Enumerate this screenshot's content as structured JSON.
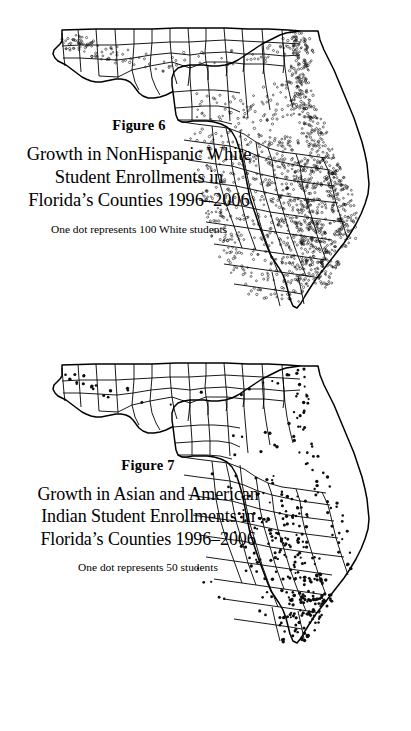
{
  "document": {
    "type": "scanned-journal-page",
    "background_color": "#ffffff",
    "ink_color": "#000000",
    "figure_count": 2
  },
  "figures": [
    {
      "id": "figure-6",
      "number_label": "Figure 6",
      "title": "Growth in NonHispanic White\nStudent Enrollments in\nFlorida’s Counties 1996–2006",
      "title_lines": [
        "Growth in NonHispanic White",
        "Student Enrollments in",
        "Florida’s Counties 1996–2006"
      ],
      "legend_caption": "One dot represents 100 White students",
      "map": {
        "subject": "Florida counties",
        "symbology": "dot-density",
        "dot_value": 100,
        "dot_unit": "White students",
        "period": "1996–2006",
        "dot_style": "small open circle",
        "dot_count_rendered": 980
      }
    },
    {
      "id": "figure-7",
      "number_label": "Figure 7",
      "title": "Growth in Asian and American\nIndian Student Enrollments in\nFlorida’s Counties 1996–2006",
      "title_lines": [
        "Growth in Asian and American",
        "Indian Student Enrollments in",
        "Florida’s Counties 1996–2006"
      ],
      "legend_caption": "One dot represents 50 students",
      "map": {
        "subject": "Florida counties",
        "symbology": "dot-density",
        "dot_value": 50,
        "dot_unit": "students",
        "period": "1996–2006",
        "dot_style": "small filled circle",
        "dot_count_rendered": 330
      }
    }
  ],
  "chart_data": [
    {
      "type": "map",
      "id": "figure-6",
      "title": "Growth in NonHispanic White Student Enrollments in Florida’s Counties 1996–2006",
      "subtitle": "Figure 6",
      "annotation": "One dot represents 100 White students",
      "map_type": "dot-density",
      "region": "Florida, USA",
      "unit_per_dot": 100,
      "measure": "Growth in NonHispanic White student enrollments",
      "period_start": 1996,
      "period_end": 2006,
      "legend": "One dot represents 100 White students",
      "regions": [
        {
          "name": "Escambia",
          "density": "moderate"
        },
        {
          "name": "Santa Rosa",
          "density": "high"
        },
        {
          "name": "Okaloosa",
          "density": "moderate"
        },
        {
          "name": "Walton",
          "density": "low"
        },
        {
          "name": "Bay",
          "density": "low"
        },
        {
          "name": "Leon",
          "density": "low"
        },
        {
          "name": "Alachua",
          "density": "low"
        },
        {
          "name": "Duval",
          "density": "very-high"
        },
        {
          "name": "Clay",
          "density": "high"
        },
        {
          "name": "St. Johns",
          "density": "very-high"
        },
        {
          "name": "Flagler",
          "density": "high"
        },
        {
          "name": "Volusia",
          "density": "high"
        },
        {
          "name": "Marion",
          "density": "high"
        },
        {
          "name": "Lake",
          "density": "high"
        },
        {
          "name": "Orange",
          "density": "high"
        },
        {
          "name": "Seminole",
          "density": "high"
        },
        {
          "name": "Brevard",
          "density": "high"
        },
        {
          "name": "Osceola",
          "density": "high"
        },
        {
          "name": "Pasco",
          "density": "very-high"
        },
        {
          "name": "Hernando",
          "density": "high"
        },
        {
          "name": "Citrus",
          "density": "moderate"
        },
        {
          "name": "Hillsborough",
          "density": "high"
        },
        {
          "name": "Pinellas",
          "density": "moderate"
        },
        {
          "name": "Manatee",
          "density": "high"
        },
        {
          "name": "Sarasota",
          "density": "high"
        },
        {
          "name": "Charlotte",
          "density": "moderate"
        },
        {
          "name": "Lee",
          "density": "very-high"
        },
        {
          "name": "Collier",
          "density": "high"
        },
        {
          "name": "Polk",
          "density": "moderate"
        },
        {
          "name": "Indian River",
          "density": "moderate"
        },
        {
          "name": "St. Lucie",
          "density": "very-high"
        },
        {
          "name": "Martin",
          "density": "moderate"
        },
        {
          "name": "Palm Beach",
          "density": "very-high"
        },
        {
          "name": "Broward",
          "density": "very-high"
        },
        {
          "name": "Miami-Dade",
          "density": "low"
        },
        {
          "name": "Monroe",
          "density": "very-low"
        }
      ]
    },
    {
      "type": "map",
      "id": "figure-7",
      "title": "Growth in Asian and American Indian Student Enrollments in Florida’s Counties 1996–2006",
      "subtitle": "Figure 7",
      "annotation": "One dot represents 50 students",
      "map_type": "dot-density",
      "region": "Florida, USA",
      "unit_per_dot": 50,
      "measure": "Growth in Asian and American Indian student enrollments",
      "period_start": 1996,
      "period_end": 2006,
      "legend": "One dot represents 50 students",
      "regions": [
        {
          "name": "Escambia",
          "density": "low"
        },
        {
          "name": "Santa Rosa",
          "density": "low"
        },
        {
          "name": "Okaloosa",
          "density": "low"
        },
        {
          "name": "Leon",
          "density": "low"
        },
        {
          "name": "Alachua",
          "density": "low"
        },
        {
          "name": "Duval",
          "density": "moderate"
        },
        {
          "name": "Clay",
          "density": "low"
        },
        {
          "name": "St. Johns",
          "density": "low"
        },
        {
          "name": "Volusia",
          "density": "low"
        },
        {
          "name": "Marion",
          "density": "low"
        },
        {
          "name": "Orange",
          "density": "high"
        },
        {
          "name": "Seminole",
          "density": "high"
        },
        {
          "name": "Brevard",
          "density": "moderate"
        },
        {
          "name": "Osceola",
          "density": "low"
        },
        {
          "name": "Hillsborough",
          "density": "moderate"
        },
        {
          "name": "Pinellas",
          "density": "moderate"
        },
        {
          "name": "Pasco",
          "density": "low"
        },
        {
          "name": "Manatee",
          "density": "low"
        },
        {
          "name": "Sarasota",
          "density": "low"
        },
        {
          "name": "Lee",
          "density": "low"
        },
        {
          "name": "Collier",
          "density": "low"
        },
        {
          "name": "Polk",
          "density": "low"
        },
        {
          "name": "St. Lucie",
          "density": "low"
        },
        {
          "name": "Palm Beach",
          "density": "high"
        },
        {
          "name": "Broward",
          "density": "very-high"
        },
        {
          "name": "Miami-Dade",
          "density": "moderate"
        },
        {
          "name": "Monroe",
          "density": "very-low"
        }
      ]
    }
  ]
}
